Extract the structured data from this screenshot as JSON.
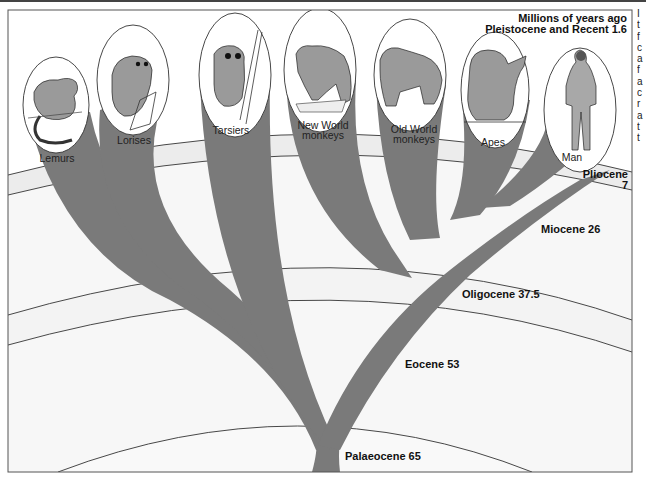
{
  "diagram": {
    "title_line1": "Millions of years ago",
    "title_line2": "Pleistocene and Recent 1.6",
    "epochs": [
      {
        "name": "Pliocene",
        "mya": "7",
        "label_line1": "Pliocene",
        "label_line2": "7"
      },
      {
        "name": "Miocene",
        "mya": "26",
        "label": "Miocene 26"
      },
      {
        "name": "Oligocene",
        "mya": "37.5",
        "label": "Oligocene 37.5"
      },
      {
        "name": "Eocene",
        "mya": "53",
        "label": "Eocene 53"
      },
      {
        "name": "Palaeocene",
        "mya": "65",
        "label": "Palaeocene 65"
      }
    ],
    "taxa": [
      {
        "name": "Lemurs",
        "line1": "Lemurs",
        "line2": ""
      },
      {
        "name": "Lorises",
        "line1": "Lorises",
        "line2": ""
      },
      {
        "name": "Tarsiers",
        "line1": "Tarsiers",
        "line2": ""
      },
      {
        "name": "New World monkeys",
        "line1": "New World",
        "line2": "monkeys"
      },
      {
        "name": "Old World monkeys",
        "line1": "Old World",
        "line2": "monkeys"
      },
      {
        "name": "Apes",
        "line1": "Apes",
        "line2": ""
      },
      {
        "name": "Man",
        "line1": "Man",
        "line2": ""
      }
    ],
    "colors": {
      "branch": "#7a7a7a",
      "branch_dark": "#6a6a6a",
      "band_light": "#efefef",
      "line": "#333333",
      "frame": "#555555"
    }
  },
  "edge_text": {
    "letters": [
      "I",
      "t",
      "f",
      "c",
      "a",
      "f",
      "a",
      "c",
      "r",
      "a",
      "t",
      "t"
    ]
  }
}
